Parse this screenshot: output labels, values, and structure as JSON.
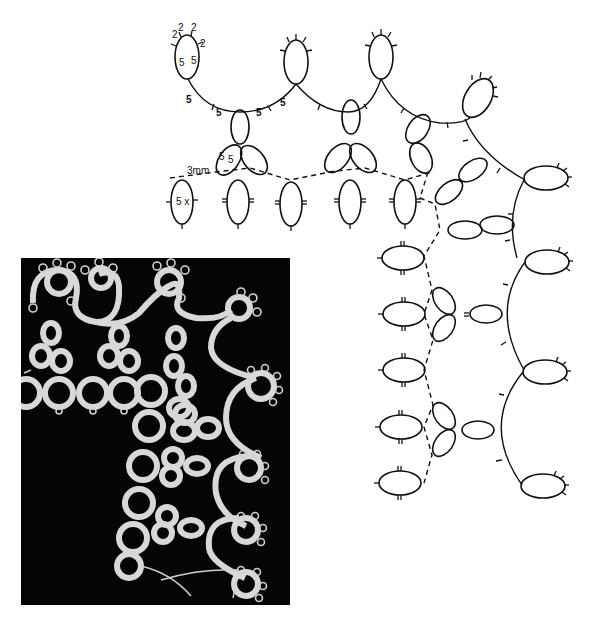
{
  "diagram": {
    "labels": {
      "picot_top_left_1": "2",
      "picot_top_left_2": "2",
      "picot_top_left_3": "2",
      "picot_top_left_4": "2",
      "ring_ds_left": "5",
      "ring_ds_right": "5",
      "chain_ds_1": "5",
      "chain_ds_2": "5",
      "chain_ds_3": "5",
      "chain_ds_4": "5",
      "clover_ds_1": "5",
      "clover_ds_2": "5",
      "thread_gap": "3mm",
      "ring_repeat": "5 x"
    }
  },
  "photo": {
    "description": "Photograph of finished tatted lace corner on black background",
    "background_color": "#050505",
    "lace_color": "#d8d8d8"
  }
}
